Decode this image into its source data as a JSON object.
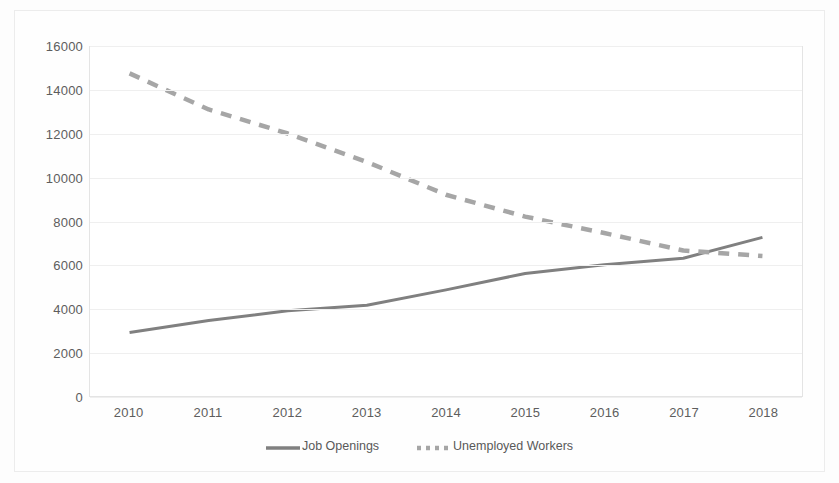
{
  "chart_data": {
    "type": "line",
    "title": "",
    "xlabel": "",
    "ylabel": "",
    "categories": [
      "2010",
      "2011",
      "2012",
      "2013",
      "2014",
      "2015",
      "2016",
      "2017",
      "2018"
    ],
    "x": [
      2010,
      2011,
      2012,
      2013,
      2014,
      2015,
      2016,
      2017,
      2018
    ],
    "ylim": [
      0,
      16000
    ],
    "yticks": [
      0,
      2000,
      4000,
      6000,
      8000,
      10000,
      12000,
      14000,
      16000
    ],
    "ytick_labels": [
      "0",
      "2000",
      "4000",
      "6000",
      "8000",
      "10000",
      "12000",
      "14000",
      "16000"
    ],
    "grid": "horizontal",
    "legend_position": "bottom",
    "series": [
      {
        "name": "Job Openings",
        "style": "solid",
        "color": "#808080",
        "values": [
          2900,
          3450,
          3900,
          4150,
          4850,
          5600,
          6000,
          6300,
          7250
        ]
      },
      {
        "name": "Unemployed Workers",
        "style": "dashed",
        "color": "#a6a6a6",
        "values": [
          14750,
          13100,
          12000,
          10700,
          9200,
          8200,
          7450,
          6650,
          6400
        ]
      }
    ]
  },
  "legend": {
    "items": [
      {
        "label": "Job Openings",
        "style": "solid"
      },
      {
        "label": "Unemployed Workers",
        "style": "dashed"
      }
    ]
  },
  "colors": {
    "series_solid": "#808080",
    "series_dashed": "#a6a6a6",
    "gridline": "#efefef",
    "axis_text": "#5d5d5d",
    "plot_background": "#ffffff"
  }
}
